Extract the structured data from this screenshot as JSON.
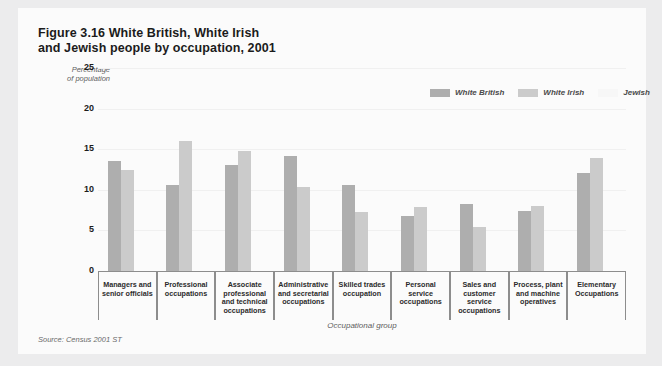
{
  "figure": {
    "title_line1": "Figure 3.16  White British, White Irish",
    "title_line2": "and Jewish people by occupation, 2001",
    "source": "Source: Census 2001 ST"
  },
  "legend": {
    "position": "top-right",
    "items": [
      {
        "label": "White British",
        "color": "#aeaeae"
      },
      {
        "label": "White Irish",
        "color": "#cbcbcb"
      },
      {
        "label": "Jewish",
        "color": "#f7f7f7"
      }
    ]
  },
  "axis": {
    "y_label_line1": "Percentage",
    "y_label_line2": "of population",
    "x_label": "Occupational group",
    "y_ticks": [
      "25",
      "20",
      "15",
      "10",
      "5",
      "0"
    ]
  },
  "chart_data": {
    "type": "bar",
    "title": "Figure 3.16  White British, White Irish and Jewish people by occupation, 2001",
    "xlabel": "Occupational group",
    "ylabel": "Percentage of population",
    "ylim": [
      0,
      25
    ],
    "yticks": [
      0,
      5,
      10,
      15,
      20,
      25
    ],
    "grid": true,
    "legend_position": "top-right",
    "categories": [
      "Managers and senior officials",
      "Professional occupations",
      "Associate professional and technical occupations",
      "Administrative and secretarial occupations",
      "Skilled trades occupation",
      "Personal service occupations",
      "Sales and customer service occupations",
      "Process, plant and machine operatives",
      "Elementary Occupations"
    ],
    "series": [
      {
        "name": "White British",
        "color": "#aeaeae",
        "values": [
          13.5,
          10.6,
          13.1,
          14.2,
          10.6,
          6.8,
          8.3,
          7.4,
          12.1
        ]
      },
      {
        "name": "White Irish",
        "color": "#cbcbcb",
        "values": [
          12.4,
          16.0,
          14.8,
          10.3,
          7.3,
          7.9,
          5.4,
          8.0,
          13.9
        ]
      },
      {
        "name": "Jewish",
        "color": "#f7f7f7",
        "values": [
          0,
          0,
          0,
          0,
          0,
          0,
          0,
          0,
          0
        ]
      }
    ]
  }
}
